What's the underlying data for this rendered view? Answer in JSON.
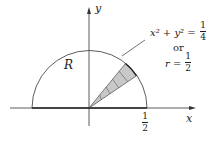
{
  "diagram": {
    "region_label": "R",
    "x_axis_label": "x",
    "y_axis_label": "y",
    "x_tick_label": {
      "numerator": "1",
      "denominator": "2"
    },
    "annotation": {
      "equation_lhs": "x² + y² =",
      "equation_rhs": {
        "numerator": "1",
        "denominator": "4"
      },
      "connector": "or",
      "polar_lhs": "r =",
      "polar_rhs": {
        "numerator": "1",
        "denominator": "2"
      }
    },
    "colors": {
      "stroke": "#222222",
      "wedge_fill": "#c8c8c8"
    }
  }
}
